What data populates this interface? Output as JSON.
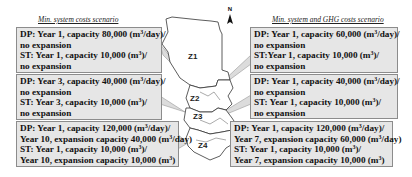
{
  "titles": {
    "left": "Min. system costs scenario",
    "right": "Min. system and GHG costs scenario"
  },
  "north_label": "N",
  "zones": [
    "Z1",
    "Z2",
    "Z3",
    "Z4"
  ],
  "left_boxes": [
    {
      "zone": "Z1",
      "lines": [
        {
          "pre": "DP: Year 1, capacity 80,000  (m",
          "sup": "3",
          "post": "/day)/"
        },
        {
          "pre": "no expansion",
          "sup": "",
          "post": ""
        },
        {
          "pre": "ST: Year 1, capacity 10,000  (m",
          "sup": "3",
          "post": ")/"
        },
        {
          "pre": "no expansion",
          "sup": "",
          "post": ""
        }
      ]
    },
    {
      "zone": "Z2",
      "lines": [
        {
          "pre": "DP: Year 3, capacity 40,000  (m",
          "sup": "3",
          "post": "/day)/"
        },
        {
          "pre": "no expansion",
          "sup": "",
          "post": ""
        },
        {
          "pre": "ST: Year 3, capacity 10,000  (m",
          "sup": "3",
          "post": ")/"
        },
        {
          "pre": "no expansion",
          "sup": "",
          "post": ""
        }
      ]
    },
    {
      "zone": "Z3",
      "lines": [
        {
          "pre": "DP: Year 1, capacity 120,000  (m",
          "sup": "3",
          "post": "/day)/"
        },
        {
          "pre": "Year 10, expansion capacity 40,000  (m",
          "sup": "3",
          "post": "/day)"
        },
        {
          "pre": "ST: Year 1, capacity 10,000  (m",
          "sup": "3",
          "post": ")/"
        },
        {
          "pre": "Year 10, expansion capacity 10,000  (m",
          "sup": "3",
          "post": ")"
        }
      ]
    }
  ],
  "right_boxes": [
    {
      "zone": "Z1",
      "lines": [
        {
          "pre": "DP: Year 1, capacity 60,000  (m",
          "sup": "3",
          "post": "/day)/"
        },
        {
          "pre": "no expansion",
          "sup": "",
          "post": ""
        },
        {
          "pre": "ST:Year 1, capacity 10,000  (m",
          "sup": "3",
          "post": ")/"
        },
        {
          "pre": "no expansion",
          "sup": "",
          "post": ""
        }
      ]
    },
    {
      "zone": "Z2",
      "lines": [
        {
          "pre": "DP: Year 1, capacity 40,000  (m",
          "sup": "3",
          "post": "/day)/"
        },
        {
          "pre": "no expansion",
          "sup": "",
          "post": ""
        },
        {
          "pre": "ST: Year 1, capacity 10,000  (m",
          "sup": "3",
          "post": ")/"
        },
        {
          "pre": "no expansion",
          "sup": "",
          "post": ""
        }
      ]
    },
    {
      "zone": "Z3",
      "lines": [
        {
          "pre": "DP: Year 1, capacity 120,000  (m",
          "sup": "3",
          "post": "/day)/"
        },
        {
          "pre": "Year 7, expansion capacity 60,000  (m",
          "sup": "3",
          "post": "/day)"
        },
        {
          "pre": "ST: Year 1, capacity 10,000  (m",
          "sup": "3",
          "post": ")/"
        },
        {
          "pre": "Year 7, expansion capacity 10,000  (m",
          "sup": "3",
          "post": ")"
        }
      ]
    }
  ],
  "colors": {
    "box_fill": "#e6e6e6",
    "box_border": "#8c8c8c",
    "map_stroke": "#333333",
    "callout_fill": "#dcdcdc"
  }
}
